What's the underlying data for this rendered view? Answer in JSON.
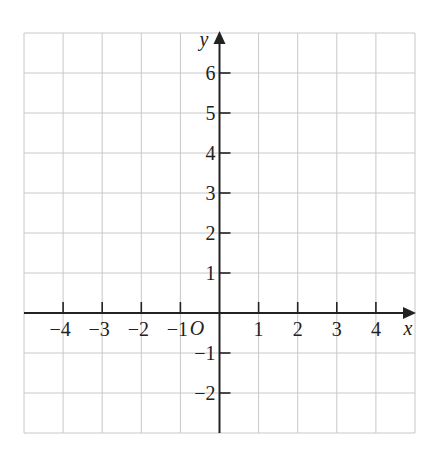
{
  "diagram": {
    "type": "coordinate-grid",
    "grid": {
      "x_min": -5,
      "x_max": 5,
      "y_min": -3,
      "y_max": 7,
      "step": 1,
      "grid_color": "#c8c8c8",
      "axis_color": "#222222"
    },
    "axes": {
      "x_label": "x",
      "y_label": "y",
      "origin_label": "O"
    },
    "x_ticks": [
      {
        "value": -4,
        "label": "−4"
      },
      {
        "value": -3,
        "label": "−3"
      },
      {
        "value": -2,
        "label": "−2"
      },
      {
        "value": -1,
        "label": "−1"
      },
      {
        "value": 1,
        "label": "1"
      },
      {
        "value": 2,
        "label": "2"
      },
      {
        "value": 3,
        "label": "3"
      },
      {
        "value": 4,
        "label": "4"
      }
    ],
    "y_ticks": [
      {
        "value": 6,
        "label": "6"
      },
      {
        "value": 5,
        "label": "5"
      },
      {
        "value": 4,
        "label": "4"
      },
      {
        "value": 3,
        "label": "3"
      },
      {
        "value": 2,
        "label": "2"
      },
      {
        "value": 1,
        "label": "1"
      },
      {
        "value": -1,
        "label": "−1"
      },
      {
        "value": -2,
        "label": "−2"
      }
    ]
  }
}
